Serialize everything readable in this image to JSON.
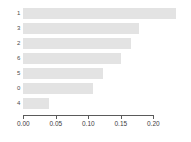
{
  "chart_data": {
    "type": "bar",
    "orientation": "horizontal",
    "title": "",
    "subtitle": "",
    "xlabel": "",
    "ylabel": "",
    "categories": [
      "1",
      "3",
      "2",
      "6",
      "5",
      "0",
      "4"
    ],
    "values": [
      0.234,
      0.177,
      0.166,
      0.15,
      0.122,
      0.107,
      0.04
    ],
    "xlim": [
      0.0,
      0.215
    ],
    "xticks": [
      0.0,
      0.05,
      0.1,
      0.15,
      0.2
    ],
    "xticklabels": [
      "0.00",
      "0.05",
      "0.10",
      "0.15",
      "0.20"
    ],
    "grid": false,
    "legend": null,
    "bar_color": "#e3e3e3",
    "axis_color": "#5a5a5a",
    "background": "#ffffff"
  }
}
